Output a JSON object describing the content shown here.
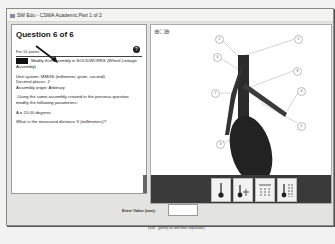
{
  "window": {
    "title": "SW Edu - CSWA Academic Part 1 of 2"
  },
  "question": {
    "title": "Question 6 of 6",
    "points": "For 10 points",
    "help_icon": "question-icon",
    "paragraphs": [
      "Modify this assembly in SOLIDWORKS (Wheel Linkage Assembly)",
      "Unit system: MMGS (millimeter, gram, second)",
      "Decimal places: 2",
      "Assembly origin: Arbitrary",
      "-Using the same assembly created in the previous question modify the following parameters:",
      "A = 20.00 degrees",
      "What is the measured distance X (millimeters)?"
    ]
  },
  "viewer": {
    "zoom_tools": [
      "zoom-in-icon",
      "fit-icon",
      "zoom-out-icon"
    ],
    "callouts": [
      "1",
      "2",
      "3",
      "4",
      "5",
      "6",
      "7",
      "8"
    ],
    "view_buttons": [
      "view-1",
      "view-2",
      "view-3",
      "view-4"
    ]
  },
  "answer": {
    "label": "Enter Value (mm):",
    "value": "",
    "hint": "(use . [point] as decimal separator)"
  }
}
